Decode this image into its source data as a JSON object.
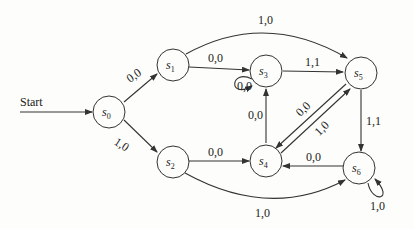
{
  "diagram": {
    "type": "finite-state-machine",
    "start_label": "Start",
    "states": [
      {
        "id": "s0",
        "name": "s",
        "sub": "0"
      },
      {
        "id": "s1",
        "name": "s",
        "sub": "1"
      },
      {
        "id": "s2",
        "name": "s",
        "sub": "2"
      },
      {
        "id": "s3",
        "name": "s",
        "sub": "3"
      },
      {
        "id": "s4",
        "name": "s",
        "sub": "4"
      },
      {
        "id": "s5",
        "name": "s",
        "sub": "5"
      },
      {
        "id": "s6",
        "name": "s",
        "sub": "6"
      }
    ],
    "transitions": [
      {
        "from": "s0",
        "to": "s1",
        "label": "0,0"
      },
      {
        "from": "s0",
        "to": "s2",
        "label": "1,0"
      },
      {
        "from": "s1",
        "to": "s3",
        "label": "0,0"
      },
      {
        "from": "s1",
        "to": "s5",
        "label": "1,0"
      },
      {
        "from": "s2",
        "to": "s4",
        "label": "0,0"
      },
      {
        "from": "s2",
        "to": "s6",
        "label": "1,0"
      },
      {
        "from": "s3",
        "to": "s3",
        "label": "0,0"
      },
      {
        "from": "s3",
        "to": "s5",
        "label": "1,1"
      },
      {
        "from": "s4",
        "to": "s3",
        "label": "0,0"
      },
      {
        "from": "s5",
        "to": "s4",
        "label": "0,0"
      },
      {
        "from": "s4",
        "to": "s5",
        "label": "1,0"
      },
      {
        "from": "s5",
        "to": "s6",
        "label": "1,1"
      },
      {
        "from": "s6",
        "to": "s4",
        "label": "0,0"
      },
      {
        "from": "s6",
        "to": "s6",
        "label": "1,0"
      }
    ]
  }
}
